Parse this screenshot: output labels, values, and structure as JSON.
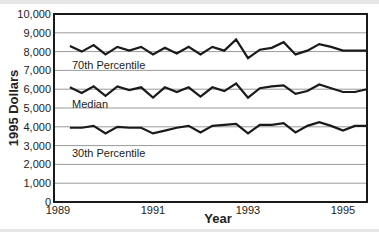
{
  "chart_data": {
    "type": "line",
    "title": "",
    "xlabel": "Year",
    "ylabel": "1995 Dollars",
    "ylim": [
      0,
      10000
    ],
    "xlim": [
      1989,
      1995.8
    ],
    "grid": true,
    "legend_position": "inline labels",
    "y_ticks": [
      "0",
      "1,000",
      "2,000",
      "3,000",
      "4,000",
      "5,000",
      "6,000",
      "7,000",
      "8,000",
      "9,000",
      "10,000"
    ],
    "x_ticks": [
      "1989",
      "1991",
      "1993",
      "1995"
    ],
    "x": [
      1989.25,
      1989.5,
      1989.75,
      1990.0,
      1990.25,
      1990.5,
      1990.75,
      1991.0,
      1991.25,
      1991.5,
      1991.75,
      1992.0,
      1992.25,
      1992.5,
      1992.75,
      1993.0,
      1993.25,
      1993.5,
      1993.75,
      1994.0,
      1994.25,
      1994.5,
      1994.75,
      1995.0,
      1995.25,
      1995.5
    ],
    "series": [
      {
        "name": "70th Percentile",
        "values": [
          8300,
          8000,
          8350,
          7850,
          8250,
          8050,
          8250,
          7850,
          8200,
          7900,
          8250,
          7850,
          8250,
          8050,
          8650,
          7650,
          8100,
          8200,
          8500,
          7850,
          8050,
          8400,
          8250,
          8050,
          8050,
          8050
        ]
      },
      {
        "name": "Median",
        "values": [
          6100,
          5800,
          6150,
          5650,
          6150,
          5950,
          6100,
          5550,
          6100,
          5850,
          6100,
          5600,
          6100,
          5900,
          6300,
          5550,
          6050,
          6150,
          6200,
          5750,
          5900,
          6250,
          6050,
          5850,
          5850,
          6000
        ]
      },
      {
        "name": "30th Percentile",
        "values": [
          3950,
          3950,
          4050,
          3650,
          4000,
          3950,
          3950,
          3650,
          3800,
          3950,
          4050,
          3700,
          4050,
          4100,
          4150,
          3650,
          4100,
          4100,
          4200,
          3700,
          4050,
          4250,
          4050,
          3800,
          4050,
          4050
        ]
      }
    ]
  },
  "labels": {
    "series_70": "70th Percentile",
    "series_median": "Median",
    "series_30": "30th Percentile",
    "ylabel": "1995 Dollars",
    "xlabel": "Year"
  },
  "colors": {
    "line": "#1a1a1a",
    "grid": "#9a9a9a",
    "axis": "#1a1a1a"
  }
}
